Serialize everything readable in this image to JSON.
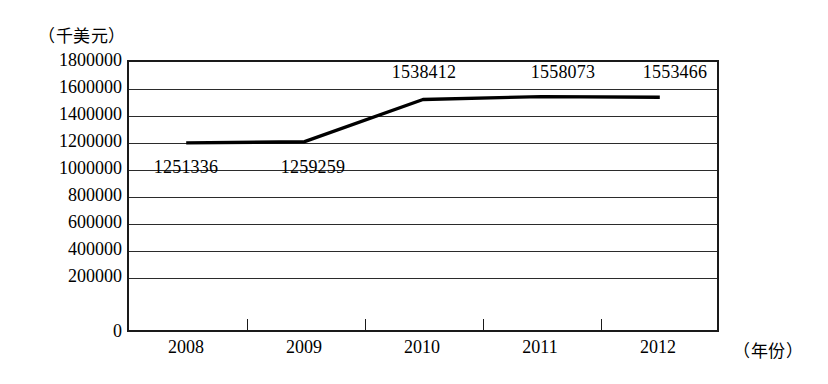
{
  "chart_data": {
    "type": "line",
    "title": "",
    "subtitle": "",
    "unit_caption": "（千美元）",
    "xlabel": "（年份）",
    "ylabel": "",
    "categories": [
      "2008",
      "2009",
      "2010",
      "2011",
      "2012"
    ],
    "values": [
      1251336,
      1259259,
      1538412,
      1558073,
      1553466
    ],
    "point_labels": [
      "1251336",
      "1259259",
      "1538412",
      "1558073",
      "1553466"
    ],
    "series": [
      {
        "name": "",
        "values": [
          1251336,
          1259259,
          1538412,
          1558073,
          1553466
        ]
      }
    ],
    "ylim": [
      0,
      1800000
    ],
    "ytick_values": [
      1800000,
      1600000,
      1400000,
      1200000,
      1000000,
      800000,
      600000,
      400000,
      200000,
      0
    ],
    "ytick_labels": [
      "1800000",
      "1600000",
      "1400000",
      "1200000",
      "1000000",
      "800000",
      "600000",
      "400000",
      "200000",
      "0"
    ],
    "grid": true,
    "grid_orientation": "horizontal",
    "legend": false,
    "legend_position": "none",
    "line_color": "#000000",
    "line_width": 3,
    "markers": false,
    "background_color": "#ffffff",
    "axis_color": "#1a1a1a"
  },
  "labels": {
    "y": {
      "t0": "1800000",
      "t1": "1600000",
      "t2": "1400000",
      "t3": "1200000",
      "t4": "1000000",
      "t5": "800000",
      "t6": "600000",
      "t7": "400000",
      "t8": "200000",
      "t9": "0"
    },
    "x": {
      "c0": "2008",
      "c1": "2009",
      "c2": "2010",
      "c3": "2011",
      "c4": "2012"
    },
    "data": {
      "d0": "1251336",
      "d1": "1259259",
      "d2": "1538412",
      "d3": "1558073",
      "d4": "1553466"
    },
    "unit": "（千美元）",
    "xaxis": "（年份）"
  }
}
